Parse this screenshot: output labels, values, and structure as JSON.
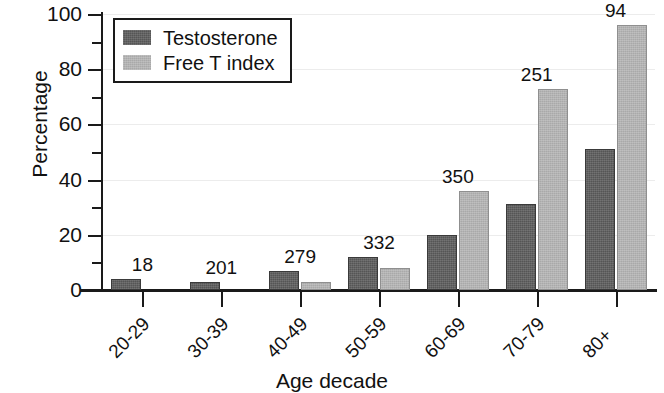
{
  "chart_data": {
    "type": "bar",
    "title": "",
    "xlabel": "Age decade",
    "ylabel": "Percentage",
    "categories": [
      "20-29",
      "30-39",
      "40-49",
      "50-59",
      "60-69",
      "70-79",
      "80+"
    ],
    "series": [
      {
        "name": "Testosterone",
        "color": "#555555",
        "values": [
          4,
          3,
          7,
          12,
          20,
          31,
          51
        ]
      },
      {
        "name": "Free T index",
        "color": "#a9a9a9",
        "values": [
          0,
          0,
          3,
          8,
          36,
          73,
          96
        ]
      }
    ],
    "group_annotations": [
      "18",
      "201",
      "279",
      "332",
      "350",
      "251",
      "94"
    ],
    "ylim": [
      0,
      100
    ],
    "y_major_ticks": [
      0,
      20,
      40,
      60,
      80,
      100
    ],
    "y_tick_labels": [
      "0",
      "20",
      "40",
      "60",
      "80",
      "100"
    ],
    "y_minor_ticks": [
      10,
      30,
      50,
      70,
      90
    ],
    "grid": "horizontal",
    "legend_position": "top-left"
  },
  "legend": {
    "items": [
      {
        "label": "Testosterone",
        "swatch": "dark"
      },
      {
        "label": "Free T index",
        "swatch": "light"
      }
    ]
  }
}
